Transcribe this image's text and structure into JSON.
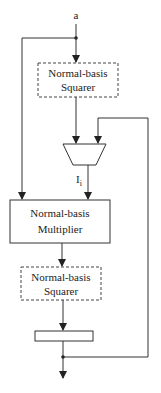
{
  "diagram": {
    "input_label": "a",
    "squarer_top": {
      "line1": "Normal-basis",
      "line2": "Squarer",
      "style": "dashed"
    },
    "mux": {
      "output_label_main": "I",
      "output_label_sub": "i"
    },
    "multiplier": {
      "line1": "Normal-basis",
      "line2": "Multiplier",
      "style": "solid"
    },
    "squarer_bottom": {
      "line1": "Normal-basis",
      "line2": "Squarer",
      "style": "dashed"
    },
    "register": {
      "label": ""
    },
    "colors": {
      "line": "#333333",
      "background": "#ffffff"
    }
  }
}
